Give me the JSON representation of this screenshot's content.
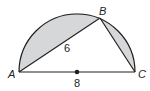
{
  "diagram": {
    "type": "semicircle-inscribed-triangle",
    "points": {
      "A": {
        "label": "A"
      },
      "B": {
        "label": "B"
      },
      "C": {
        "label": "C"
      }
    },
    "segments": {
      "AB": {
        "length_label": "6"
      },
      "AC": {
        "length_label": "8",
        "is_diameter": true
      }
    },
    "colors": {
      "shading": "#d6d7d9",
      "stroke": "#231f20"
    }
  }
}
